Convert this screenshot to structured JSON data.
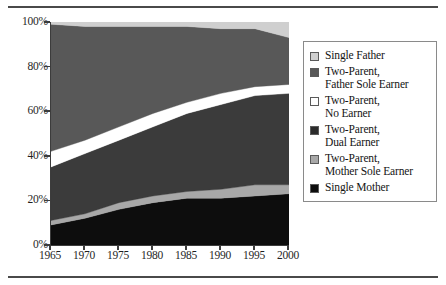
{
  "figure": {
    "top_rule": "",
    "bottom_rule": ""
  },
  "chart_data": {
    "type": "area",
    "stacked": true,
    "normalized_percent": true,
    "title": "",
    "subtitle": "",
    "xlabel": "",
    "ylabel": "",
    "x": [
      1965,
      1970,
      1975,
      1980,
      1985,
      1990,
      1995,
      2000
    ],
    "xtick_labels": [
      "1965",
      "1970",
      "1975",
      "1980",
      "1985",
      "1990",
      "1995",
      "2000"
    ],
    "ytick_labels": [
      "0%",
      "20%",
      "40%",
      "60%",
      "80%",
      "100%"
    ],
    "ytick_values": [
      0,
      20,
      40,
      60,
      80,
      100
    ],
    "xlim": [
      1965,
      2000
    ],
    "ylim": [
      0,
      100
    ],
    "grid": false,
    "legend_position": "right",
    "stack_order_bottom_to_top": [
      "Single Mother",
      "Two-Parent, Mother Sole Earner",
      "Two-Parent, Dual Earner",
      "Two-Parent, No Earner",
      "Two-Parent, Father Sole Earner",
      "Single Father"
    ],
    "series": [
      {
        "name": "Single Mother",
        "color": "#0d0d0d",
        "values": [
          9,
          12,
          16,
          19,
          21,
          21,
          22,
          23
        ]
      },
      {
        "name": "Two-Parent, Mother Sole Earner",
        "color": "#a8a8a8",
        "values": [
          2,
          2,
          3,
          3,
          3,
          4,
          5,
          4
        ]
      },
      {
        "name": "Two-Parent, Dual Earner",
        "color": "#3b3b3b",
        "values": [
          24,
          27,
          28,
          31,
          35,
          38,
          40,
          41
        ]
      },
      {
        "name": "Two-Parent, No Earner",
        "color": "#ffffff",
        "values": [
          7,
          6,
          6,
          6,
          5,
          5,
          4,
          4
        ]
      },
      {
        "name": "Two-Parent, Father Sole Earner",
        "color": "#585858",
        "values": [
          57,
          51,
          45,
          39,
          34,
          29,
          26,
          21
        ]
      },
      {
        "name": "Single Father",
        "color": "#cfcfcf",
        "values": [
          1,
          2,
          2,
          2,
          2,
          3,
          3,
          7
        ]
      }
    ],
    "cumulative_top_boundaries": {
      "single_mother": [
        9,
        12,
        16,
        19,
        21,
        21,
        22,
        23
      ],
      "mother_sole_earner": [
        11,
        14,
        19,
        22,
        24,
        25,
        27,
        27
      ],
      "dual_earner": [
        35,
        41,
        47,
        53,
        59,
        63,
        67,
        68
      ],
      "no_earner": [
        42,
        47,
        53,
        59,
        64,
        68,
        71,
        72
      ],
      "father_sole_earner": [
        99,
        98,
        98,
        98,
        98,
        97,
        97,
        93
      ],
      "single_father": [
        100,
        100,
        100,
        100,
        100,
        100,
        100,
        100
      ]
    }
  },
  "legend": {
    "items": [
      {
        "label_line1": "Single Father",
        "label_line2": "",
        "color": "#cfcfcf"
      },
      {
        "label_line1": "Two-Parent,",
        "label_line2": "Father Sole Earner",
        "color": "#585858"
      },
      {
        "label_line1": "Two-Parent,",
        "label_line2": "No Earner",
        "color": "#ffffff"
      },
      {
        "label_line1": "Two-Parent,",
        "label_line2": "Dual Earner",
        "color": "#2b2b2b"
      },
      {
        "label_line1": "Two-Parent,",
        "label_line2": "Mother Sole Earner",
        "color": "#a8a8a8"
      },
      {
        "label_line1": "Single Mother",
        "label_line2": "",
        "color": "#0d0d0d"
      }
    ]
  }
}
